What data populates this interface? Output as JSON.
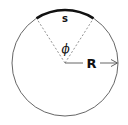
{
  "diagram": {
    "labels": {
      "arc": "s",
      "angle": "ϕ",
      "radius": "R"
    },
    "colors": {
      "circle": "#555555",
      "arc": "#111111",
      "dashed": "#777777",
      "text": "#111111"
    }
  }
}
